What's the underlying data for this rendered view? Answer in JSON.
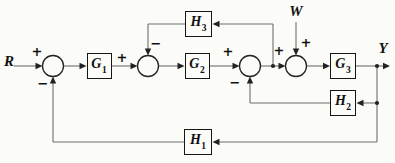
{
  "signals": {
    "input": "R",
    "disturbance": "W",
    "output": "Y"
  },
  "blocks": {
    "g1": {
      "base": "G",
      "sub": "1"
    },
    "g2": {
      "base": "G",
      "sub": "2"
    },
    "g3": {
      "base": "G",
      "sub": "3"
    },
    "h1": {
      "base": "H",
      "sub": "1"
    },
    "h2": {
      "base": "H",
      "sub": "2"
    },
    "h3": {
      "base": "H",
      "sub": "3"
    }
  },
  "signs": {
    "sum1_input": "+",
    "sum1_feedback": "−",
    "sum2_input": "+",
    "sum2_feedback": "−",
    "sum3_input": "+",
    "sum3_feedback": "−",
    "sum4_input": "+",
    "sum4_disturbance": "+"
  },
  "colors": {
    "background": "#fbfbf8",
    "line": "#6e6e6e",
    "accent": "#222222",
    "block_border": "#161616",
    "text": "#101010"
  }
}
